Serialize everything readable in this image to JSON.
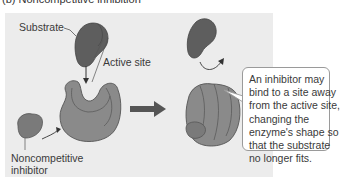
{
  "diagram": {
    "title_fragments": [
      "(b) Noncompetitive inhibition"
    ],
    "labels": {
      "substrate": "Substrate",
      "active_site": "Active site",
      "inhibitor_line1": "Noncompetitive",
      "inhibitor_line2": "inhibitor"
    },
    "callout": {
      "lines": [
        "An inhibitor may",
        "bind to a site away",
        "from the active site,",
        "changing the",
        "enzyme's shape so",
        "that the substrate",
        "no longer fits."
      ]
    },
    "colors": {
      "panel_bg": "#ececec",
      "enzyme": "#8a8a8a",
      "enzyme_dark": "#6e6e6e",
      "substrate": "#5e5e5e",
      "inhibitor": "#7a7a7a",
      "arrow": "#555555",
      "callout_border": "#9a9a9a"
    }
  }
}
